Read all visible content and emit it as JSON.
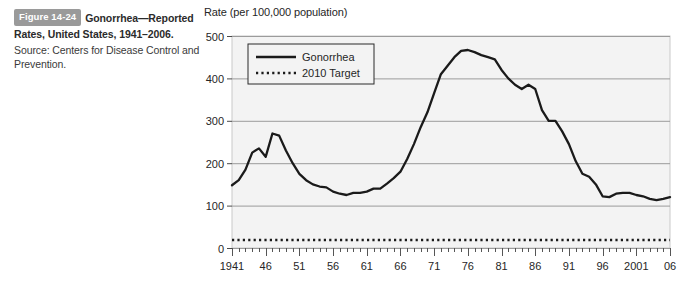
{
  "caption": {
    "badge": "Figure 14-24",
    "title": "Gonorrhea—Reported Rates, United States, 1941–2006.",
    "source": "Source: Centers for Disease Control and Prevention."
  },
  "chart_data": {
    "type": "line",
    "title": "Rate (per 100,000 population)",
    "xlabel": "",
    "ylabel": "Rate (per 100,000 population)",
    "ylim": [
      0,
      500
    ],
    "yticks": [
      0,
      100,
      200,
      300,
      400,
      500
    ],
    "ytick_labels": [
      "0",
      "100",
      "200",
      "300",
      "400",
      "500"
    ],
    "xlim": [
      1941,
      2006
    ],
    "xtick_labels": [
      "1941",
      "46",
      "51",
      "56",
      "61",
      "66",
      "71",
      "76",
      "81",
      "86",
      "91",
      "96",
      "2001",
      "06"
    ],
    "xtick_years": [
      1941,
      1946,
      1951,
      1956,
      1961,
      1966,
      1971,
      1976,
      1981,
      1986,
      1991,
      1996,
      2001,
      2006
    ],
    "minor_tick_interval": 1,
    "grid": "horizontal",
    "legend_position": "top-left",
    "legend": [
      "Gonorrhea",
      "2010 Target"
    ],
    "colors": {
      "line": "#1a1a1a",
      "target": "#1a1a1a",
      "plot_background": "#f3f3f3",
      "grid": "#9b9b9b",
      "badge": "#9a9a9a"
    },
    "series": [
      {
        "name": "Gonorrhea",
        "style": "solid",
        "x": [
          1941,
          1942,
          1943,
          1944,
          1945,
          1946,
          1947,
          1948,
          1949,
          1950,
          1951,
          1952,
          1953,
          1954,
          1955,
          1956,
          1957,
          1958,
          1959,
          1960,
          1961,
          1962,
          1963,
          1964,
          1965,
          1966,
          1967,
          1968,
          1969,
          1970,
          1971,
          1972,
          1973,
          1974,
          1975,
          1976,
          1977,
          1978,
          1979,
          1980,
          1981,
          1982,
          1983,
          1984,
          1985,
          1986,
          1987,
          1988,
          1989,
          1990,
          1991,
          1992,
          1993,
          1994,
          1995,
          1996,
          1997,
          1998,
          1999,
          2000,
          2001,
          2002,
          2003,
          2004,
          2005,
          2006
        ],
        "y": [
          148,
          160,
          185,
          225,
          235,
          215,
          270,
          265,
          230,
          200,
          175,
          160,
          150,
          145,
          143,
          133,
          128,
          125,
          130,
          130,
          133,
          140,
          140,
          152,
          165,
          180,
          210,
          245,
          285,
          320,
          365,
          410,
          430,
          450,
          465,
          467,
          462,
          455,
          450,
          445,
          420,
          400,
          385,
          375,
          385,
          375,
          325,
          300,
          300,
          275,
          245,
          205,
          175,
          168,
          150,
          122,
          120,
          128,
          130,
          130,
          125,
          122,
          116,
          113,
          116,
          120
        ]
      },
      {
        "name": "2010 Target",
        "style": "dotted",
        "x": [
          1941,
          2006
        ],
        "y": [
          19,
          19
        ]
      }
    ]
  }
}
